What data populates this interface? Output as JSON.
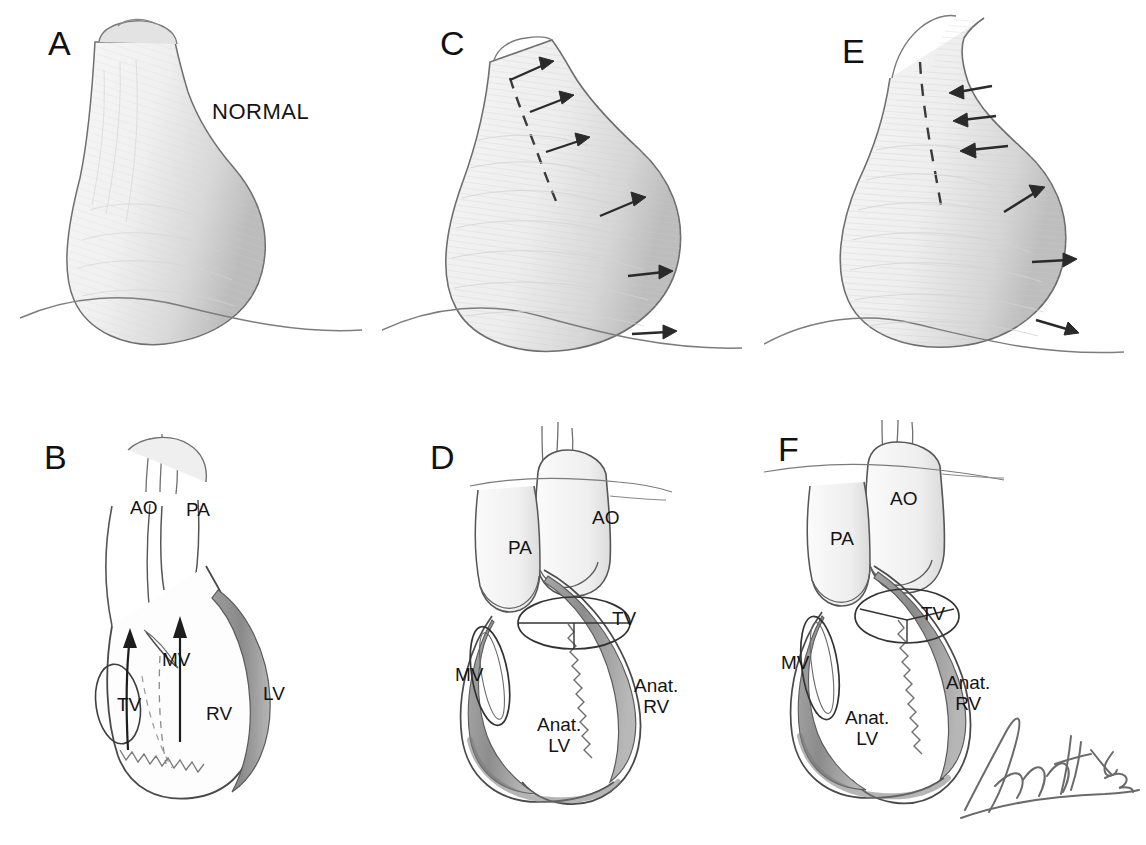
{
  "figure": {
    "background_color": "#ffffff",
    "ink_color": "#2b2b2b",
    "label_color": "#141414",
    "signature": "Finch '82",
    "signature_artist": "Finch",
    "signature_year": "82"
  },
  "panels": [
    {
      "id": "A",
      "letter": "A",
      "type": "cardiac-silhouette",
      "caption": "NORMAL",
      "labels": [
        {
          "text": "NORMAL",
          "x": 212,
          "y": 100,
          "size": "big"
        }
      ],
      "arrows": [],
      "dashed_contour": false
    },
    {
      "id": "B",
      "letter": "B",
      "type": "heart-anatomy",
      "caption": "",
      "labels": [
        {
          "text": "AO",
          "x": 130,
          "y": 498
        },
        {
          "text": "PA",
          "x": 186,
          "y": 500
        },
        {
          "text": "MV",
          "x": 162,
          "y": 650
        },
        {
          "text": "TV",
          "x": 117,
          "y": 695
        },
        {
          "text": "RV",
          "x": 206,
          "y": 704
        },
        {
          "text": "LV",
          "x": 263,
          "y": 684
        }
      ],
      "flow_arrows": 2
    },
    {
      "id": "C",
      "letter": "C",
      "type": "cardiac-silhouette",
      "caption": "",
      "labels": [],
      "arrow_count": 6,
      "arrow_direction": "outward-right",
      "dashed_contour": true
    },
    {
      "id": "D",
      "letter": "D",
      "type": "heart-anatomy",
      "caption": "",
      "labels": [
        {
          "text": "AO",
          "x": 592,
          "y": 508
        },
        {
          "text": "PA",
          "x": 508,
          "y": 538
        },
        {
          "text": "TV",
          "x": 612,
          "y": 609
        },
        {
          "text": "MV",
          "x": 455,
          "y": 665
        },
        {
          "text": "Anat.\nRV",
          "x": 634,
          "y": 676
        },
        {
          "text": "Anat.\nLV",
          "x": 537,
          "y": 715
        }
      ]
    },
    {
      "id": "E",
      "letter": "E",
      "type": "cardiac-silhouette",
      "caption": "",
      "labels": [],
      "arrow_count": 6,
      "arrow_direction": "mixed-inward-top-outward-bottom",
      "dashed_contour": true
    },
    {
      "id": "F",
      "letter": "F",
      "type": "heart-anatomy",
      "caption": "",
      "labels": [
        {
          "text": "AO",
          "x": 890,
          "y": 489
        },
        {
          "text": "PA",
          "x": 830,
          "y": 529
        },
        {
          "text": "TV",
          "x": 921,
          "y": 604
        },
        {
          "text": "MV",
          "x": 781,
          "y": 653
        },
        {
          "text": "Anat.\nRV",
          "x": 946,
          "y": 673
        },
        {
          "text": "Anat.\nLV",
          "x": 845,
          "y": 708
        }
      ]
    }
  ],
  "panel_letters": [
    {
      "id": "A",
      "text": "A",
      "x": 48,
      "y": 26
    },
    {
      "id": "C",
      "text": "C",
      "x": 440,
      "y": 26
    },
    {
      "id": "E",
      "text": "E",
      "x": 842,
      "y": 34
    },
    {
      "id": "B",
      "text": "B",
      "x": 44,
      "y": 440
    },
    {
      "id": "D",
      "text": "D",
      "x": 430,
      "y": 440
    },
    {
      "id": "F",
      "text": "F",
      "x": 778,
      "y": 432
    }
  ]
}
